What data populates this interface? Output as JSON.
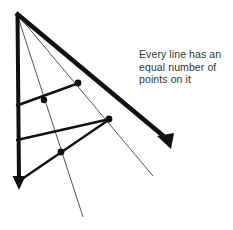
{
  "page": {
    "background_color": "#ffffff",
    "width": 233,
    "height": 230
  },
  "caption": {
    "text": "Every line has an\nequal number of\npoints on it",
    "lines": [
      "Every line has an",
      "equal number of",
      "points on it"
    ],
    "color": "#333333"
  },
  "figure": {
    "apex": {
      "x": 17,
      "y": 14
    },
    "colors": {
      "bold_stroke": "#111111",
      "thin_stroke": "#555555",
      "point_fill": "#111111"
    },
    "stroke_widths": {
      "bold": 4,
      "medium": 2.4,
      "thin": 1
    },
    "rays": [
      {
        "name": "vertical-ray",
        "style": "bold",
        "arrow": true,
        "from": {
          "x": 17,
          "y": 14
        },
        "to": {
          "x": 19,
          "y": 186
        }
      },
      {
        "name": "diagonal-ray",
        "style": "bold",
        "arrow": true,
        "from": {
          "x": 17,
          "y": 14
        },
        "to": {
          "x": 171,
          "y": 142
        }
      },
      {
        "name": "thin-ray-left",
        "style": "thin",
        "arrow": false,
        "from": {
          "x": 17,
          "y": 14
        },
        "to": {
          "x": 83,
          "y": 217
        }
      },
      {
        "name": "thin-ray-right",
        "style": "thin",
        "arrow": false,
        "from": {
          "x": 17,
          "y": 14
        },
        "to": {
          "x": 153,
          "y": 176
        }
      }
    ],
    "transversals": [
      {
        "name": "transversal-upper",
        "style": "medium",
        "from": {
          "x": 17,
          "y": 105
        },
        "to": {
          "x": 78,
          "y": 83
        }
      },
      {
        "name": "transversal-middle",
        "style": "medium",
        "from": {
          "x": 17,
          "y": 140
        },
        "to": {
          "x": 110,
          "y": 119
        }
      },
      {
        "name": "transversal-lower",
        "style": "medium",
        "from": {
          "x": 19,
          "y": 181
        },
        "to": {
          "x": 110,
          "y": 119
        }
      }
    ],
    "points": [
      {
        "name": "point-upper-thin-left",
        "x": 44,
        "y": 100,
        "r": 3.2
      },
      {
        "name": "point-upper-diagonal",
        "x": 78,
        "y": 83,
        "r": 3.4
      },
      {
        "name": "point-middle-diagonal",
        "x": 109,
        "y": 119,
        "r": 3.4
      },
      {
        "name": "point-lower-thin-left",
        "x": 61,
        "y": 152,
        "r": 3.4
      }
    ],
    "arrowheads": [
      {
        "name": "arrowhead-down",
        "tip": {
          "x": 19,
          "y": 188
        }
      },
      {
        "name": "arrowhead-diagonal",
        "tip": {
          "x": 173,
          "y": 144
        }
      }
    ]
  }
}
